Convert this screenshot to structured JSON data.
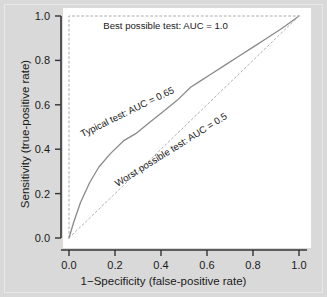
{
  "chart_data": {
    "type": "line",
    "title": "",
    "xlabel": "1−Specificity (false-positive rate)",
    "ylabel": "Sensitivity (true-positive rate)",
    "xlim": [
      0.0,
      1.0
    ],
    "ylim": [
      0.0,
      1.0
    ],
    "xticks": [
      "0.0",
      "0.2",
      "0.4",
      "0.6",
      "0.8",
      "1.0"
    ],
    "xtick_values": [
      0.0,
      0.2,
      0.4,
      0.6,
      0.8,
      1.0
    ],
    "yticks": [
      "0.0",
      "0.2",
      "0.4",
      "0.6",
      "0.8",
      "1.0"
    ],
    "ytick_values": [
      0.0,
      0.2,
      0.4,
      0.6,
      0.8,
      1.0
    ],
    "grid": false,
    "legend_position": "inline-annotations",
    "series": [
      {
        "name": "Best possible test",
        "auc": 1.0,
        "style": "dashed",
        "color": "#aaaaaa",
        "x": [
          0.0,
          0.0,
          1.0
        ],
        "y": [
          0.0,
          1.0,
          1.0
        ]
      },
      {
        "name": "Typical test",
        "auc": 0.65,
        "style": "solid",
        "color": "#8a8a8a",
        "x": [
          0.0,
          0.02,
          0.05,
          0.09,
          0.13,
          0.18,
          0.24,
          0.29,
          0.35,
          0.41,
          0.47,
          0.53,
          0.56,
          0.62,
          0.68,
          0.74,
          0.8,
          0.86,
          0.92,
          0.96,
          1.0
        ],
        "y": [
          0.0,
          0.07,
          0.16,
          0.25,
          0.32,
          0.38,
          0.44,
          0.47,
          0.52,
          0.57,
          0.62,
          0.68,
          0.7,
          0.74,
          0.78,
          0.82,
          0.86,
          0.9,
          0.94,
          0.97,
          1.0
        ]
      },
      {
        "name": "Worst possible test",
        "auc": 0.5,
        "style": "dashed",
        "color": "#b0b0b0",
        "x": [
          0.0,
          1.0
        ],
        "y": [
          0.0,
          1.0
        ]
      }
    ],
    "annotations": [
      {
        "id": "best-possible-label",
        "text": "Best possible test: AUC = 1.0",
        "x": 0.42,
        "y": 0.955,
        "rotation": 0
      },
      {
        "id": "typical-test-label",
        "text": "Typical test: AUC = 0.65",
        "x": 0.255,
        "y": 0.565,
        "rotation": -26
      },
      {
        "id": "worst-possible-label",
        "text": "Worst possible test: AUC = 0.5",
        "x": 0.445,
        "y": 0.395,
        "rotation": -32
      }
    ]
  }
}
